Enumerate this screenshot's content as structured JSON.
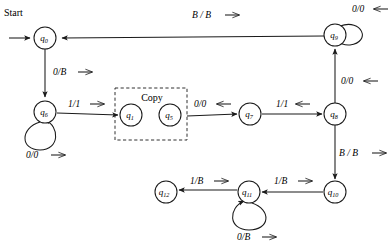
{
  "diagram": {
    "start_label": "Start",
    "group_box_label": "Copy",
    "colors": {
      "stroke": "#1a1a1a",
      "background": "#ffffff",
      "text": "#000000"
    },
    "nodes": [
      {
        "id": "q0",
        "label": "q",
        "sub": "0",
        "cx": 45,
        "cy": 38,
        "r": 11
      },
      {
        "id": "q9",
        "label": "q",
        "sub": "9",
        "cx": 335,
        "cy": 35,
        "r": 11
      },
      {
        "id": "q6",
        "label": "q",
        "sub": "6",
        "cx": 45,
        "cy": 112,
        "r": 11
      },
      {
        "id": "q1",
        "label": "q",
        "sub": "1",
        "cx": 131,
        "cy": 115,
        "r": 11
      },
      {
        "id": "q5",
        "label": "q",
        "sub": "5",
        "cx": 170,
        "cy": 115,
        "r": 11
      },
      {
        "id": "q7",
        "label": "q",
        "sub": "7",
        "cx": 250,
        "cy": 114,
        "r": 11
      },
      {
        "id": "q8",
        "label": "q",
        "sub": "8",
        "cx": 335,
        "cy": 114,
        "r": 11
      },
      {
        "id": "q10",
        "label": "q",
        "sub": "10",
        "cx": 335,
        "cy": 192,
        "r": 11
      },
      {
        "id": "q11",
        "label": "q",
        "sub": "11",
        "cx": 249,
        "cy": 192,
        "r": 11
      },
      {
        "id": "q12",
        "label": "q",
        "sub": "12",
        "cx": 166,
        "cy": 192,
        "r": 11
      }
    ],
    "transitions": [
      {
        "name": "start-to-q0",
        "from": "start",
        "to": "q0",
        "label": ""
      },
      {
        "name": "q9-to-q0",
        "from": "q9",
        "to": "q0",
        "label": "B / B"
      },
      {
        "name": "q0-to-q6",
        "from": "q0",
        "to": "q6",
        "label": "0/B"
      },
      {
        "name": "q6-self",
        "from": "q6",
        "to": "q6",
        "label": "0/0"
      },
      {
        "name": "q6-to-copy",
        "from": "q6",
        "to": "q1",
        "label": "1/1"
      },
      {
        "name": "copy-to-q7",
        "from": "q5",
        "to": "q7",
        "label": "0/0"
      },
      {
        "name": "q7-to-q8",
        "from": "q7",
        "to": "q8",
        "label": "1/1"
      },
      {
        "name": "q8-to-q9",
        "from": "q8",
        "to": "q9",
        "label": "0/0"
      },
      {
        "name": "q9-self",
        "from": "q9",
        "to": "q9",
        "label": "0/0"
      },
      {
        "name": "q8-to-q10",
        "from": "q8",
        "to": "q10",
        "label": "B / B"
      },
      {
        "name": "q10-to-q11",
        "from": "q10",
        "to": "q11",
        "label": "1/B"
      },
      {
        "name": "q11-to-q12",
        "from": "q11",
        "to": "q12",
        "label": "1/B"
      },
      {
        "name": "q11-self",
        "from": "q11",
        "to": "q11",
        "label": "0/B"
      }
    ],
    "edge_labels": [
      {
        "name": "label-b-over-b-top",
        "text": "B / B",
        "arrow": "right",
        "x": 192,
        "y": 18
      },
      {
        "name": "label-0-over-0-topright",
        "text": "0/0",
        "arrow": "left",
        "x": 355,
        "y": 10
      },
      {
        "name": "label-0-over-b-left",
        "text": "0/B",
        "arrow": "right",
        "x": 55,
        "y": 73
      },
      {
        "name": "label-1-over-1-left",
        "text": "1/1",
        "arrow": "right",
        "x": 71,
        "y": 106
      },
      {
        "name": "label-0-over-0-mid",
        "text": "0/0",
        "arrow": "left",
        "x": 196,
        "y": 106
      },
      {
        "name": "label-1-over-1-mid",
        "text": "1/1",
        "arrow": "left",
        "x": 277,
        "y": 106
      },
      {
        "name": "label-0-over-0-right",
        "text": "0/0",
        "arrow": "left",
        "x": 343,
        "y": 82
      },
      {
        "name": "label-0-over-0-q6",
        "text": "0/0",
        "arrow": "right",
        "x": 28,
        "y": 155
      },
      {
        "name": "label-b-over-b-right",
        "text": "B / B",
        "arrow": "right",
        "x": 341,
        "y": 152
      },
      {
        "name": "label-1-over-b-a",
        "text": "1/B",
        "arrow": "right",
        "x": 275,
        "y": 183
      },
      {
        "name": "label-1-over-b-b",
        "text": "1/B",
        "arrow": "right",
        "x": 192,
        "y": 183
      },
      {
        "name": "label-0-over-b-loop",
        "text": "0/B",
        "arrow": "right",
        "x": 239,
        "y": 238
      }
    ]
  }
}
